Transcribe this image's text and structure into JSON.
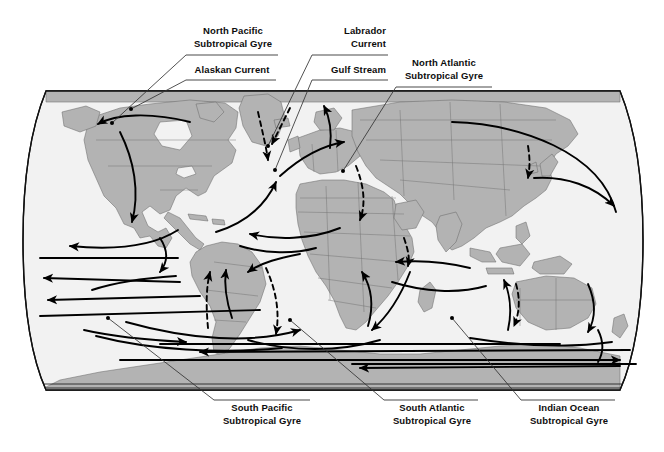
{
  "figure": {
    "kind": "world-map-diagram",
    "projection": "oval (Robinson-style) world map"
  },
  "colors": {
    "land_fill": "#b3b3b3",
    "land_stroke": "#6e6e6e",
    "ocean_fill": "#f2f2f2",
    "outline": "#111111",
    "arrow": "#000000",
    "text": "#0d0d0d",
    "leader": "#333333",
    "background": "#ffffff"
  },
  "labels": [
    {
      "id": "north-pacific-subtropical-gyre",
      "line1": "North Pacific",
      "line2": "Subtropical Gyre",
      "align": "center",
      "x": 190,
      "y": 25,
      "w": 86,
      "rule_y": 55,
      "rule_x1": 186,
      "rule_x2": 278,
      "leader": [
        [
          186,
          55
        ],
        [
          112,
          123
        ]
      ],
      "dot": [
        112,
        123
      ]
    },
    {
      "id": "alaskan-current",
      "line1": "Alaskan Current",
      "line2": "",
      "align": "center",
      "x": 190,
      "y": 64,
      "w": 84,
      "rule_y": 80,
      "rule_x1": 186,
      "rule_x2": 276,
      "leader": [
        [
          186,
          80
        ],
        [
          131,
          109
        ]
      ],
      "dot": [
        131,
        109
      ]
    },
    {
      "id": "labrador-current",
      "line1": "Labrador",
      "line2": "Current",
      "align": "right",
      "x": 318,
      "y": 25,
      "w": 68,
      "rule_y": 55,
      "rule_x1": 312,
      "rule_x2": 388,
      "leader": [
        [
          312,
          55
        ],
        [
          268,
          146
        ]
      ],
      "dot": [
        268,
        146
      ]
    },
    {
      "id": "gulf-stream",
      "line1": "Gulf Stream",
      "line2": "",
      "align": "right",
      "x": 318,
      "y": 64,
      "w": 68,
      "rule_y": 80,
      "rule_x1": 312,
      "rule_x2": 388,
      "leader": [
        [
          312,
          80
        ],
        [
          275,
          170
        ]
      ],
      "dot": [
        275,
        170
      ]
    },
    {
      "id": "north-atlantic-subtropical-gyre",
      "line1": "North Atlantic",
      "line2": "Subtropical Gyre",
      "align": "center",
      "x": 400,
      "y": 57,
      "w": 88,
      "rule_y": 87,
      "rule_x1": 396,
      "rule_x2": 492,
      "leader": [
        [
          396,
          87
        ],
        [
          343,
          171
        ]
      ],
      "dot": [
        343,
        171
      ]
    },
    {
      "id": "south-pacific-subtropical-gyre",
      "line1": "South Pacific",
      "line2": "Subtropical Gyre",
      "align": "center",
      "x": 218,
      "y": 402,
      "w": 88,
      "rule_y": 400,
      "rule_x1": 214,
      "rule_x2": 310,
      "leader": [
        [
          214,
          400
        ],
        [
          108,
          318
        ]
      ],
      "dot": [
        108,
        318
      ]
    },
    {
      "id": "south-atlantic-subtropical-gyre",
      "line1": "South Atlantic",
      "line2": "Subtropical Gyre",
      "align": "center",
      "x": 388,
      "y": 402,
      "w": 88,
      "rule_y": 400,
      "rule_x1": 384,
      "rule_x2": 478,
      "leader": [
        [
          384,
          400
        ],
        [
          290,
          320
        ]
      ],
      "dot": [
        290,
        320
      ]
    },
    {
      "id": "indian-ocean-subtropical-gyre",
      "line1": "Indian Ocean",
      "line2": "Subtropical Gyre",
      "align": "center",
      "x": 525,
      "y": 402,
      "w": 88,
      "rule_y": 400,
      "rule_x1": 521,
      "rule_x2": 615,
      "leader": [
        [
          521,
          400
        ],
        [
          452,
          318
        ]
      ],
      "dot": [
        452,
        318
      ]
    }
  ],
  "named_currents": [
    "North Pacific Subtropical Gyre",
    "Alaskan Current",
    "Labrador Current",
    "Gulf Stream",
    "North Atlantic Subtropical Gyre",
    "South Pacific Subtropical Gyre",
    "South Atlantic Subtropical Gyre",
    "Indian Ocean Subtropical Gyre"
  ]
}
